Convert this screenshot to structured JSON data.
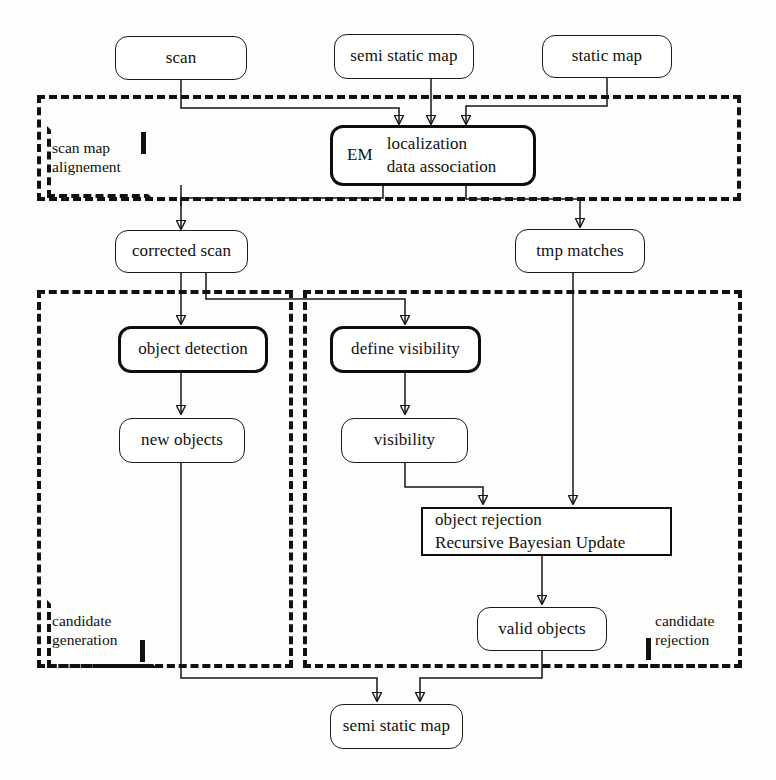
{
  "diagram": {
    "nodes": {
      "scan": "scan",
      "semi_static_map_top": "semi static map",
      "static_map": "static map",
      "em_tag": "EM",
      "em_line1": "localization",
      "em_line2": "data association",
      "corrected_scan": "corrected scan",
      "tmp_matches": "tmp matches",
      "object_detection": "object detection",
      "define_visibility": "define visibility",
      "new_objects": "new objects",
      "visibility": "visibility",
      "object_rejection_line1": "object rejection",
      "object_rejection_line2": "Recursive Bayesian Update",
      "valid_objects": "valid objects",
      "semi_static_map_bottom": "semi static map"
    },
    "groups": {
      "scan_map_alignement_line1": "scan map",
      "scan_map_alignement_line2": "alignement",
      "candidate_generation_line1": "candidate",
      "candidate_generation_line2": "generation",
      "candidate_rejection_line1": "candidate",
      "candidate_rejection_line2": "rejection"
    },
    "colors": {
      "ink": "#141414",
      "paper": "#fdfdfc",
      "dashed": "#111111"
    }
  }
}
